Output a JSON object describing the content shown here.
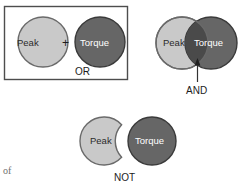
{
  "figure": {
    "type": "boolean-logic-venn-diagram",
    "caption_fragment": "of",
    "terms": {
      "peak": "Peak",
      "torque": "Torque"
    },
    "colors": {
      "light_fill": "#c9c9c9",
      "light_stroke": "#6a6a6a",
      "dark_fill": "#666666",
      "dark_stroke": "#3a3a3a",
      "overlap_fill": "#4a4a4a",
      "box_stroke": "#4d4d4d",
      "leader_line": "#333333",
      "light_text": "#2b2b2b",
      "dark_text": "#ffffff",
      "background": "#ffffff"
    },
    "groups": [
      {
        "id": "or",
        "operator_label": "OR",
        "boxed": true,
        "operator_symbol": "+",
        "left_circle": {
          "label": "Peak",
          "shade": "light"
        },
        "right_circle": {
          "label": "Torque",
          "shade": "dark"
        },
        "relationship": "separate circles joined by a plus sign inside a rectangle"
      },
      {
        "id": "and",
        "operator_label": "AND",
        "boxed": false,
        "operator_symbol": "",
        "left_circle": {
          "label": "Peak",
          "shade": "light"
        },
        "right_circle": {
          "label": "Torque",
          "shade": "dark"
        },
        "relationship": "overlapping circles with a leader line pointing at the intersection"
      },
      {
        "id": "not",
        "operator_label": "NOT",
        "boxed": false,
        "operator_symbol": "",
        "left_circle": {
          "label": "Peak",
          "shade": "light",
          "shape": "crescent"
        },
        "right_circle": {
          "label": "Torque",
          "shade": "dark"
        },
        "relationship": "light circle with a bite removed beside a separate dark circle"
      }
    ]
  }
}
